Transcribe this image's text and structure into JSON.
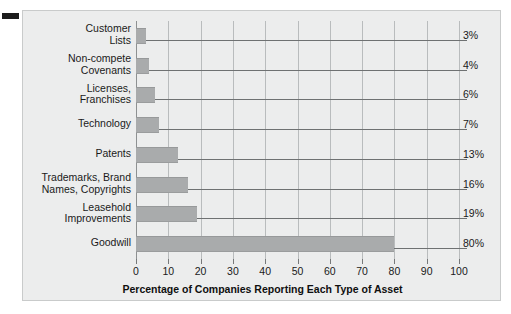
{
  "chart_data": {
    "type": "bar",
    "orientation": "horizontal",
    "title": "",
    "xlabel": "Percentage of Companies Reporting Each Type of Asset",
    "ylabel": "",
    "xlim": [
      0,
      100
    ],
    "xticks": [
      0,
      10,
      20,
      30,
      40,
      50,
      60,
      70,
      80,
      90,
      100
    ],
    "xtick_labels": [
      "0",
      "10",
      "20",
      "30",
      "40",
      "50",
      "60",
      "70",
      "80",
      "90",
      "100"
    ],
    "grid": "vertical",
    "legend": "none",
    "categories": [
      "Customer\nLists",
      "Non-compete\nCovenants",
      "Licenses,\nFranchises",
      "Technology",
      "Patents",
      "Trademarks, Brand\nNames, Copyrights",
      "Leasehold\nImprovements",
      "Goodwill"
    ],
    "values": [
      3,
      4,
      6,
      7,
      13,
      16,
      19,
      80
    ],
    "value_labels": [
      "3%",
      "4%",
      "6%",
      "7%",
      "13%",
      "16%",
      "19%",
      "80%"
    ],
    "bar_color": "#a9abac",
    "background_color": "#eceded",
    "grid_color": "#b9bcbd",
    "text_color": "#1a1a1a"
  }
}
